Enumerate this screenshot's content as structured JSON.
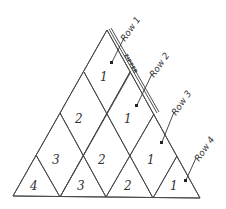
{
  "diagram": {
    "type": "triangular-quilt-layout",
    "stroke_color": "#4a4a4a",
    "zipper_label": "ZIPPER",
    "row_labels": [
      "Row 1",
      "Row 2",
      "Row 3",
      "Row 4"
    ],
    "cells": [
      {
        "row": 1,
        "label": "1"
      },
      {
        "row": 2,
        "label": "2"
      },
      {
        "row": 2,
        "label": "1"
      },
      {
        "row": 3,
        "label": "3"
      },
      {
        "row": 3,
        "label": "2"
      },
      {
        "row": 3,
        "label": "1"
      },
      {
        "row": 4,
        "label": "4"
      },
      {
        "row": 4,
        "label": "3"
      },
      {
        "row": 4,
        "label": "2"
      },
      {
        "row": 4,
        "label": "1"
      }
    ]
  }
}
